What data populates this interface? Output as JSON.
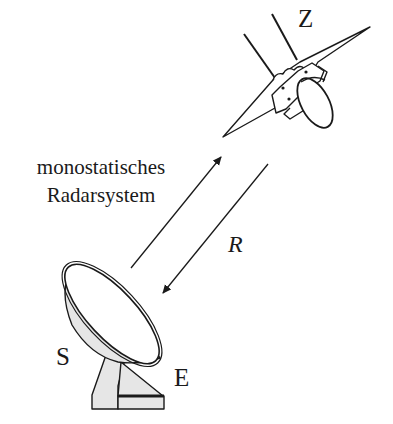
{
  "diagram": {
    "caption_line1": "monostatisches",
    "caption_line2": "Radarsystem",
    "target_label": "Z",
    "range_label": "R",
    "sender_label": "S",
    "receiver_label": "E",
    "elements": [
      {
        "id": "radar-antenna",
        "type": "dish",
        "labels": [
          "S",
          "E"
        ]
      },
      {
        "id": "transmit-arrow",
        "direction": "antenna-to-target"
      },
      {
        "id": "echo-arrow",
        "direction": "target-to-antenna",
        "label": "R"
      },
      {
        "id": "target-aircraft",
        "label": "Z"
      }
    ],
    "colors": {
      "line": "#1a1a1a",
      "fill": "#e6e6e6",
      "background": "#ffffff"
    }
  }
}
